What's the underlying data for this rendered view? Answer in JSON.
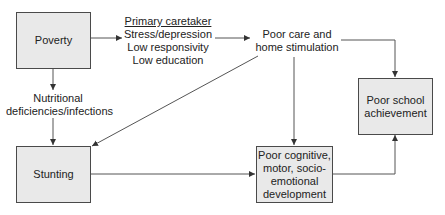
{
  "diagram": {
    "type": "flowchart",
    "nodes": {
      "poverty": "Poverty",
      "stunting": "Stunting",
      "cognitive": [
        "Poor cognitive,",
        "motor, socio-",
        "emotional",
        "development"
      ],
      "school": [
        "Poor school",
        "achievement"
      ]
    },
    "labels": {
      "caretaker_title": "Primary caretaker",
      "caretaker_lines": [
        "Stress/depression",
        "Low responsivity",
        "Low education"
      ],
      "poor_care": [
        "Poor care and",
        "home stimulation"
      ],
      "nutritional": [
        "Nutritional",
        "deficiencies/infections"
      ]
    },
    "edges": [
      {
        "from": "Poverty",
        "to": "Primary caretaker"
      },
      {
        "from": "Primary caretaker",
        "to": "Poor care and home stimulation"
      },
      {
        "from": "Poverty",
        "to": "Stunting",
        "via": "Nutritional deficiencies/infections"
      },
      {
        "from": "Poor care and home stimulation",
        "to": "Stunting"
      },
      {
        "from": "Poor care and home stimulation",
        "to": "Poor cognitive, motor, socio-emotional development"
      },
      {
        "from": "Poor care and home stimulation",
        "to": "Poor school achievement"
      },
      {
        "from": "Stunting",
        "to": "Poor cognitive, motor, socio-emotional development"
      },
      {
        "from": "Poor cognitive, motor, socio-emotional development",
        "to": "Poor school achievement"
      }
    ],
    "colors": {
      "box_fill": "#e9e9e9",
      "stroke": "#4a4a4a"
    }
  }
}
